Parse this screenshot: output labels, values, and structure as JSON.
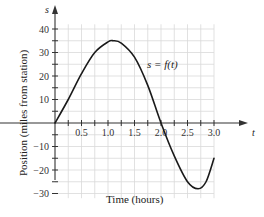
{
  "chart_data": {
    "type": "line",
    "title": "",
    "xlabel": "Time (hours)",
    "ylabel": "Position (miles from station)",
    "x_axis_symbol": "t",
    "y_axis_symbol": "s",
    "curve_label": "s = f(t)",
    "xlim": [
      0,
      3.0
    ],
    "ylim": [
      -32,
      42
    ],
    "grid": true,
    "x_ticks": [
      0.5,
      1.0,
      1.5,
      2.0,
      2.5,
      3.0
    ],
    "x_tick_labels": [
      "0.5",
      "1.0",
      "1.5",
      "2.0",
      "2.5",
      "3.0"
    ],
    "y_ticks": [
      40,
      30,
      20,
      10,
      -10,
      -20,
      -30
    ],
    "y_tick_labels": [
      "40",
      "30",
      "20",
      "10",
      "−10",
      "−20",
      "−30"
    ],
    "series": [
      {
        "name": "s = f(t)",
        "x": [
          0,
          0.25,
          0.5,
          0.75,
          1.0,
          1.1,
          1.25,
          1.5,
          1.75,
          2.0,
          2.25,
          2.5,
          2.7,
          2.85,
          3.0
        ],
        "values": [
          0,
          10,
          21,
          30,
          34.5,
          35,
          34,
          28,
          16,
          0,
          -14,
          -25,
          -28,
          -25,
          -15
        ]
      }
    ],
    "legend": null
  },
  "colors": {
    "curve": "#1a1a1a",
    "axis": "#333333",
    "grid": "#d9d9d9"
  }
}
